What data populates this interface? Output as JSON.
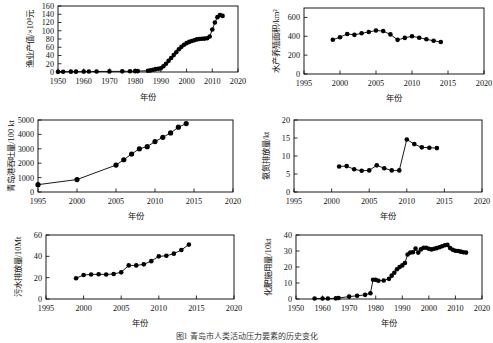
{
  "figure": {
    "caption": "图1  青岛市人类活动压力要素的历史变化",
    "panel_count": 6,
    "marker_color": "#000000",
    "frame_color": "#000000",
    "background": "#ffffff"
  },
  "chart_data": [
    {
      "id": "fishery-output-value",
      "type": "scatter",
      "title": "",
      "xlabel": "年份",
      "ylabel": "渔业产值/×10⁸元",
      "xlim": [
        1950,
        2020
      ],
      "ylim": [
        0,
        160
      ],
      "xticks": [
        1950,
        1960,
        1970,
        1980,
        1990,
        2000,
        2010,
        2020
      ],
      "yticks": [
        0,
        20,
        40,
        60,
        80,
        100,
        120,
        140,
        160
      ],
      "grid": false,
      "legend": "none",
      "x": [
        1950,
        1952,
        1955,
        1957,
        1960,
        1962,
        1965,
        1970,
        1975,
        1978,
        1980,
        1981,
        1985,
        1986,
        1987,
        1988,
        1989,
        1990,
        1991,
        1992,
        1993,
        1994,
        1995,
        1996,
        1997,
        1998,
        1999,
        2000,
        2001,
        2002,
        2003,
        2004,
        2005,
        2006,
        2007,
        2008,
        2009,
        2010,
        2011,
        2012,
        2013,
        2014
      ],
      "values": [
        0.4,
        0.6,
        0.8,
        0.9,
        1.0,
        1.1,
        1.2,
        1.4,
        1.6,
        1.8,
        2.0,
        2.2,
        3.0,
        4.0,
        5.5,
        7.0,
        8.0,
        9.0,
        14.0,
        20.0,
        27.0,
        34.0,
        41.0,
        48.0,
        55.0,
        61.0,
        66.0,
        70.0,
        73.0,
        75.0,
        77.0,
        79.0,
        80.0,
        80.5,
        81.0,
        82.0,
        86.0,
        103.0,
        120.0,
        133.0,
        138.0,
        136.0
      ]
    },
    {
      "id": "aquaculture-area",
      "type": "scatter",
      "title": "",
      "xlabel": "年份",
      "ylabel": "水产养殖面积/km²",
      "xlim": [
        1995,
        2020
      ],
      "ylim": [
        0,
        700
      ],
      "xticks": [
        1995,
        2000,
        2005,
        2010,
        2015,
        2020
      ],
      "yticks": [
        0,
        200,
        400,
        600
      ],
      "grid": false,
      "legend": "none",
      "x": [
        1999,
        2000,
        2001,
        2002,
        2003,
        2004,
        2005,
        2006,
        2007,
        2008,
        2009,
        2010,
        2011,
        2012,
        2013,
        2014
      ],
      "values": [
        363,
        390,
        425,
        415,
        432,
        445,
        462,
        455,
        420,
        362,
        383,
        400,
        385,
        368,
        352,
        340
      ]
    },
    {
      "id": "qingdao-port-throughput",
      "type": "line",
      "title": "",
      "xlabel": "年份",
      "ylabel": "青岛港吞吐量/100 kt",
      "xlim": [
        1995,
        2020
      ],
      "ylim": [
        0,
        5000
      ],
      "xticks": [
        1995,
        2000,
        2005,
        2010,
        2015,
        2020
      ],
      "yticks": [
        0,
        1000,
        2000,
        3000,
        4000,
        5000
      ],
      "grid": false,
      "legend": "none",
      "x": [
        1995,
        2000,
        2005,
        2006,
        2007,
        2008,
        2009,
        2010,
        2011,
        2012,
        2013,
        2014
      ],
      "values": [
        510,
        865,
        1870,
        2240,
        2640,
        3000,
        3150,
        3500,
        3800,
        4100,
        4500,
        4750
      ]
    },
    {
      "id": "ammonia-nitrogen-discharge",
      "type": "scatter",
      "title": "",
      "xlabel": "年份",
      "ylabel": "氨氮排放量/kt",
      "xlim": [
        1995,
        2020
      ],
      "ylim": [
        0,
        20
      ],
      "xticks": [
        1995,
        2000,
        2005,
        2010,
        2015,
        2020
      ],
      "yticks": [
        0,
        5,
        10,
        15,
        20
      ],
      "grid": false,
      "legend": "none",
      "x": [
        2001,
        2002,
        2003,
        2004,
        2005,
        2006,
        2007,
        2008,
        2009,
        2010,
        2011,
        2012,
        2013,
        2014
      ],
      "values": [
        7.1,
        7.2,
        6.3,
        5.9,
        6.0,
        7.4,
        6.6,
        6.0,
        6.0,
        14.6,
        13.3,
        12.4,
        12.3,
        12.2
      ]
    },
    {
      "id": "wastewater-discharge",
      "type": "scatter",
      "title": "",
      "xlabel": "年份",
      "ylabel": "污水排放量/10Mt",
      "xlim": [
        1995,
        2020
      ],
      "ylim": [
        0,
        60
      ],
      "xticks": [
        1995,
        2000,
        2005,
        2010,
        2015,
        2020
      ],
      "yticks": [
        0,
        20,
        40,
        60
      ],
      "grid": false,
      "legend": "none",
      "x": [
        1999,
        2000,
        2001,
        2002,
        2003,
        2004,
        2005,
        2006,
        2007,
        2008,
        2009,
        2010,
        2011,
        2012,
        2013,
        2014
      ],
      "values": [
        19.5,
        22.5,
        23.0,
        23.2,
        23.0,
        23.5,
        25.0,
        31.5,
        31.5,
        32.5,
        35.5,
        40.0,
        40.5,
        42.5,
        46.0,
        51.0
      ]
    },
    {
      "id": "fertilizer-application",
      "type": "scatter",
      "title": "",
      "xlabel": "年份",
      "ylabel": "化肥施用量/10kt",
      "xlim": [
        1950,
        2020
      ],
      "ylim": [
        0,
        40
      ],
      "xticks": [
        1950,
        1960,
        1970,
        1980,
        1990,
        2000,
        2010,
        2020
      ],
      "yticks": [
        0,
        10,
        20,
        30,
        40
      ],
      "grid": false,
      "legend": "none",
      "x": [
        1957,
        1960,
        1962,
        1965,
        1966,
        1970,
        1973,
        1976,
        1978,
        1979,
        1980,
        1981,
        1983,
        1985,
        1986,
        1987,
        1988,
        1989,
        1990,
        1991,
        1992,
        1993,
        1994,
        1995,
        1996,
        1997,
        1998,
        1999,
        2000,
        2001,
        2002,
        2003,
        2004,
        2005,
        2006,
        2007,
        2008,
        2009,
        2010,
        2011,
        2012,
        2013,
        2014
      ],
      "values": [
        0.3,
        0.3,
        0.3,
        0.4,
        0.6,
        1.5,
        2.0,
        2.6,
        3.6,
        12.0,
        12.0,
        11.4,
        11.6,
        12.6,
        14.6,
        16.4,
        18.6,
        20.0,
        21.0,
        22.5,
        27.8,
        29.0,
        29.2,
        31.5,
        29.0,
        31.0,
        32.0,
        32.0,
        31.4,
        31.0,
        31.4,
        31.8,
        32.3,
        33.0,
        33.6,
        33.8,
        31.8,
        30.8,
        30.2,
        30.0,
        29.6,
        29.2,
        29.0
      ]
    }
  ]
}
